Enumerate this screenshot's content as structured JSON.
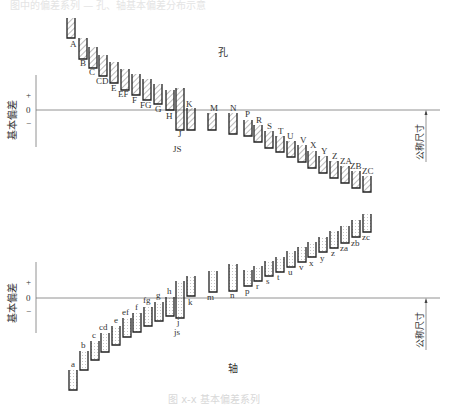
{
  "top_faint_text": "图中的偏差系列 — 孔、轴基本偏差分布示意",
  "caption": "图 x-x 基本偏差系列",
  "hole": {
    "title": "孔",
    "axis_label": "基本偏差",
    "size_label": "公称尺寸",
    "plus": "+",
    "zero": "0",
    "minus": "−",
    "bars": [
      {
        "label": "A",
        "x": 67,
        "top": 18,
        "bottom": 38,
        "lx": 70,
        "ly": 47
      },
      {
        "label": "B",
        "x": 79,
        "top": 38,
        "bottom": 59,
        "lx": 80,
        "ly": 66
      },
      {
        "label": "C",
        "x": 89,
        "top": 47,
        "bottom": 68,
        "lx": 89,
        "ly": 75
      },
      {
        "label": "CD",
        "x": 99,
        "top": 55,
        "bottom": 76,
        "lx": 96,
        "ly": 84
      },
      {
        "label": "E",
        "x": 110,
        "top": 62,
        "bottom": 83,
        "lx": 111,
        "ly": 91
      },
      {
        "label": "EF",
        "x": 121,
        "top": 69,
        "bottom": 90,
        "lx": 118,
        "ly": 97
      },
      {
        "label": "F",
        "x": 132,
        "top": 74,
        "bottom": 95,
        "lx": 132,
        "ly": 103
      },
      {
        "label": "FG",
        "x": 143,
        "top": 79,
        "bottom": 100,
        "lx": 140,
        "ly": 108
      },
      {
        "label": "G",
        "x": 154,
        "top": 84,
        "bottom": 104,
        "lx": 155,
        "ly": 112
      },
      {
        "label": "H",
        "x": 166,
        "top": 90,
        "bottom": 110,
        "lx": 166,
        "ly": 119
      },
      {
        "label": "J",
        "x": 176,
        "top": 88,
        "bottom": 130,
        "lx": 178,
        "ly": 137
      },
      {
        "label": "K",
        "x": 187,
        "top": 108,
        "bottom": 130,
        "lx": 186,
        "ly": 107
      },
      {
        "label": "M",
        "x": 208,
        "top": 113,
        "bottom": 130,
        "lx": 210,
        "ly": 111
      },
      {
        "label": "N",
        "x": 229,
        "top": 113,
        "bottom": 134,
        "lx": 230,
        "ly": 111
      },
      {
        "label": "P",
        "x": 244,
        "top": 120,
        "bottom": 136,
        "lx": 245,
        "ly": 117
      },
      {
        "label": "R",
        "x": 254,
        "top": 125,
        "bottom": 142,
        "lx": 256,
        "ly": 123
      },
      {
        "label": "S",
        "x": 265,
        "top": 131,
        "bottom": 148,
        "lx": 267,
        "ly": 129
      },
      {
        "label": "T",
        "x": 276,
        "top": 136,
        "bottom": 152,
        "lx": 278,
        "ly": 134
      },
      {
        "label": "U",
        "x": 287,
        "top": 141,
        "bottom": 157,
        "lx": 287,
        "ly": 139
      },
      {
        "label": "V",
        "x": 298,
        "top": 145,
        "bottom": 162,
        "lx": 300,
        "ly": 143
      },
      {
        "label": "X",
        "x": 308,
        "top": 151,
        "bottom": 168,
        "lx": 310,
        "ly": 148
      },
      {
        "label": "Y",
        "x": 319,
        "top": 156,
        "bottom": 173,
        "lx": 321,
        "ly": 154
      },
      {
        "label": "Z",
        "x": 330,
        "top": 161,
        "bottom": 178,
        "lx": 332,
        "ly": 159
      },
      {
        "label": "ZA",
        "x": 341,
        "top": 166,
        "bottom": 183,
        "lx": 340,
        "ly": 164
      },
      {
        "label": "ZB",
        "x": 352,
        "top": 171,
        "bottom": 188,
        "lx": 350,
        "ly": 169
      },
      {
        "label": "ZC",
        "x": 363,
        "top": 176,
        "bottom": 192,
        "lx": 362,
        "ly": 174
      }
    ],
    "js": {
      "label": "JS",
      "lx": 173,
      "ly": 152
    }
  },
  "shaft": {
    "title": "轴",
    "axis_label": "基本偏差",
    "size_label": "公称尺寸",
    "plus": "+",
    "zero": "0",
    "minus": "−",
    "bars": [
      {
        "label": "a",
        "x": 69,
        "top": 370,
        "bottom": 390,
        "lx": 71,
        "ly": 367
      },
      {
        "label": "b",
        "x": 80,
        "top": 351,
        "bottom": 370,
        "lx": 81,
        "ly": 348
      },
      {
        "label": "c",
        "x": 91,
        "top": 341,
        "bottom": 360,
        "lx": 92,
        "ly": 338
      },
      {
        "label": "cd",
        "x": 101,
        "top": 333,
        "bottom": 352,
        "lx": 99,
        "ly": 330
      },
      {
        "label": "e",
        "x": 112,
        "top": 326,
        "bottom": 345,
        "lx": 114,
        "ly": 323
      },
      {
        "label": "ef",
        "x": 123,
        "top": 318,
        "bottom": 337,
        "lx": 122,
        "ly": 315
      },
      {
        "label": "f",
        "x": 133,
        "top": 313,
        "bottom": 332,
        "lx": 135,
        "ly": 310
      },
      {
        "label": "fg",
        "x": 144,
        "top": 307,
        "bottom": 326,
        "lx": 143,
        "ly": 303
      },
      {
        "label": "g",
        "x": 155,
        "top": 302,
        "bottom": 321,
        "lx": 156,
        "ly": 298
      },
      {
        "label": "h",
        "x": 166,
        "top": 297,
        "bottom": 316,
        "lx": 167,
        "ly": 294
      },
      {
        "label": "j",
        "x": 176,
        "top": 281,
        "bottom": 318,
        "lx": 177,
        "ly": 325
      },
      {
        "label": "k",
        "x": 187,
        "top": 276,
        "bottom": 296,
        "lx": 188,
        "ly": 305
      },
      {
        "label": "m",
        "x": 209,
        "top": 271,
        "bottom": 292,
        "lx": 207,
        "ly": 300
      },
      {
        "label": "n",
        "x": 229,
        "top": 264,
        "bottom": 291,
        "lx": 230,
        "ly": 298
      },
      {
        "label": "p",
        "x": 244,
        "top": 270,
        "bottom": 286,
        "lx": 245,
        "ly": 294
      },
      {
        "label": "r",
        "x": 254,
        "top": 266,
        "bottom": 281,
        "lx": 256,
        "ly": 289
      },
      {
        "label": "s",
        "x": 265,
        "top": 261,
        "bottom": 276,
        "lx": 266,
        "ly": 284
      },
      {
        "label": "t",
        "x": 276,
        "top": 257,
        "bottom": 272,
        "lx": 277,
        "ly": 280
      },
      {
        "label": "u",
        "x": 287,
        "top": 251,
        "bottom": 267,
        "lx": 288,
        "ly": 275
      },
      {
        "label": "v",
        "x": 298,
        "top": 247,
        "bottom": 262,
        "lx": 299,
        "ly": 270
      },
      {
        "label": "x",
        "x": 308,
        "top": 242,
        "bottom": 257,
        "lx": 309,
        "ly": 266
      },
      {
        "label": "y",
        "x": 319,
        "top": 237,
        "bottom": 252,
        "lx": 320,
        "ly": 261
      },
      {
        "label": "z",
        "x": 330,
        "top": 231,
        "bottom": 248,
        "lx": 331,
        "ly": 256
      },
      {
        "label": "za",
        "x": 341,
        "top": 226,
        "bottom": 243,
        "lx": 340,
        "ly": 251
      },
      {
        "label": "zb",
        "x": 352,
        "top": 220,
        "bottom": 237,
        "lx": 351,
        "ly": 246
      },
      {
        "label": "zc",
        "x": 363,
        "top": 214,
        "bottom": 232,
        "lx": 362,
        "ly": 240
      }
    ],
    "js": {
      "label": "js",
      "lx": 174,
      "ly": 335
    }
  }
}
